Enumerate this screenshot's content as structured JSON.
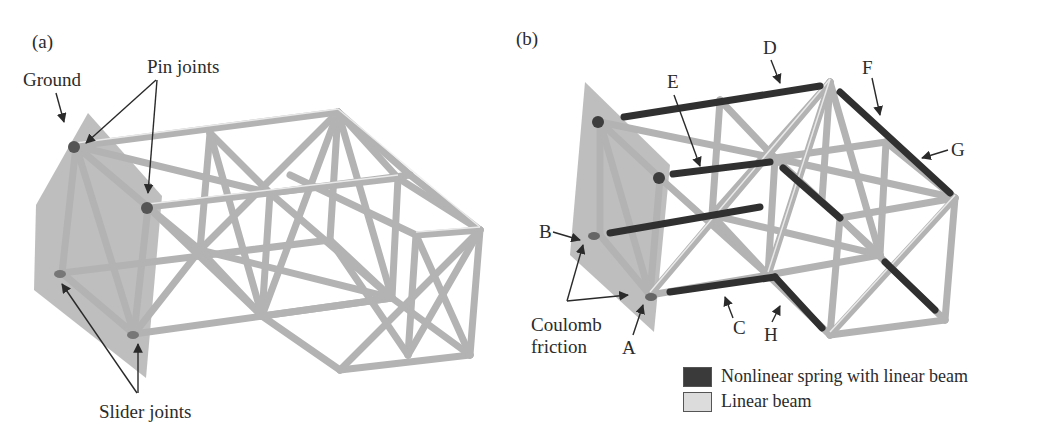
{
  "panels": [
    {
      "id": "a",
      "label": "(a)",
      "annotations": {
        "ground": "Ground",
        "pin_joints": "Pin joints",
        "slider_joints": "Slider joints"
      }
    },
    {
      "id": "b",
      "label": "(b)",
      "annotations": {
        "coulomb_friction": "Coulomb friction",
        "coulomb_line1": "Coulomb",
        "coulomb_line2": "friction",
        "points": [
          "A",
          "B",
          "C",
          "D",
          "E",
          "F",
          "G",
          "H"
        ]
      }
    }
  ],
  "legend": {
    "items": [
      {
        "label": "Nonlinear spring with linear beam",
        "color": "#3a3a3a"
      },
      {
        "label": "Linear beam",
        "color": "#dcdcdc"
      }
    ]
  },
  "colors": {
    "beam_light": "#b8b8b8",
    "beam_highlight": "#ececec",
    "beam_dark": "#303030",
    "ground_plate": "#a9a9a9",
    "joint": "#555555"
  }
}
